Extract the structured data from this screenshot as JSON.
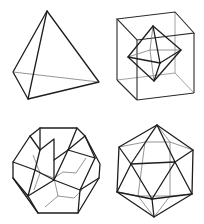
{
  "figure": {
    "panels": [
      {
        "id": "tetrahedron",
        "name": "Tetrahedron",
        "position": "top-left"
      },
      {
        "id": "cube-octahedron",
        "name": "Octahedron inscribed in cube",
        "position": "top-right"
      },
      {
        "id": "dodecahedron",
        "name": "Dodecahedron",
        "position": "bottom-left"
      },
      {
        "id": "icosahedron",
        "name": "Icosahedron",
        "position": "bottom-right"
      }
    ],
    "colors": {
      "background": "#ffffff",
      "visible_edge": "#1e1e1e",
      "hidden_edge": "#7a7a7a"
    }
  }
}
